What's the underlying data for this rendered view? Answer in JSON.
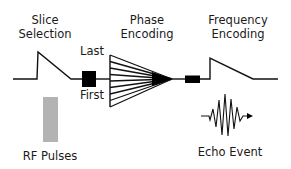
{
  "diagram": {
    "labels": {
      "slice_selection_line1": "Slice",
      "slice_selection_line2": "Selection",
      "phase_encoding_line1": "Phase",
      "phase_encoding_line2": "Encoding",
      "frequency_encoding_line1": "Frequency",
      "frequency_encoding_line2": "Encoding",
      "last": "Last",
      "first": "First",
      "rf_pulses": "RF Pulses",
      "echo_event": "Echo Event"
    },
    "phase_encoding_steps": 9,
    "colors": {
      "line": "#111111",
      "rf_pulse": "#b3b3b3",
      "background": "#ffffff"
    }
  }
}
